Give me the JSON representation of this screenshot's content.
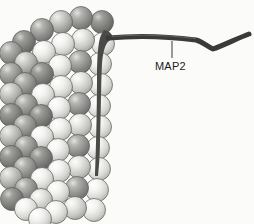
{
  "figure": {
    "name": "microtubule-with-map2-diagram",
    "background_color": "#fbfbfa",
    "width": 254,
    "height": 224
  },
  "labels": [
    {
      "id": "map2",
      "text": "MAP2",
      "x": 155,
      "y": 69,
      "color": "#1c1c1c",
      "font_size": 11,
      "leader_line": {
        "x1": 172,
        "y1": 40,
        "x2": 172,
        "y2": 58,
        "color": "#4a4a4a"
      }
    }
  ],
  "structures": {
    "microtubule": {
      "name": "microtubule-lattice",
      "description": "Helical lattice of globular tubulin subunits rendered as shaded spheres",
      "subunit_shape": "sphere",
      "subunit_diameter": 22,
      "row_count": 9,
      "columns_per_row": 5,
      "tones": {
        "light": "#f0f0ee",
        "light_mid": "#dcdcda",
        "mid": "#b8b8b6",
        "dark": "#8e8e8c",
        "darker": "#767674",
        "outline": "#5a5a58",
        "highlight": "#ffffff"
      },
      "tone_pattern": [
        [
          "dark",
          "dark",
          "mid",
          "dark",
          "dark"
        ],
        [
          "mid",
          "light",
          "light",
          "light",
          "light"
        ],
        [
          "light",
          "light",
          "dark",
          "dark",
          "light"
        ],
        [
          "dark",
          "dark",
          "light",
          "light",
          "light"
        ],
        [
          "light",
          "light",
          "dark",
          "dark",
          "light"
        ],
        [
          "dark",
          "light",
          "light",
          "light",
          "light"
        ],
        [
          "light",
          "light",
          "dark",
          "dark",
          "light"
        ],
        [
          "dark",
          "dark",
          "light",
          "light",
          "light"
        ],
        [
          "light",
          "light",
          "light",
          "light",
          "light"
        ]
      ]
    },
    "map2_filament": {
      "name": "map2-filament",
      "description": "MAP2 projection arm extending from the microtubule surface",
      "stroke_color": "#3a3a38",
      "stroke_width": 5,
      "path_points": [
        {
          "x": 109,
          "y": 38
        },
        {
          "x": 150,
          "y": 37
        },
        {
          "x": 196,
          "y": 40
        },
        {
          "x": 213,
          "y": 49
        },
        {
          "x": 232,
          "y": 39
        },
        {
          "x": 249,
          "y": 34
        }
      ],
      "base": {
        "name": "map2-attachment-base",
        "fill_color": "#4a4a48",
        "description": "Dark tapered foot anchoring the filament along the right wall of the microtubule"
      }
    }
  }
}
